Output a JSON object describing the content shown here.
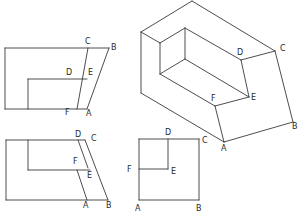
{
  "figure": {
    "type": "orthographic and isometric projections of a stepped block",
    "stroke_color": "#3a3a3a",
    "background": "#ffffff"
  },
  "views": {
    "front_view": {
      "name": "Top-left view",
      "labels": {
        "C": "C",
        "B": "B",
        "D": "D",
        "E": "E",
        "F": "F",
        "A": "A"
      },
      "lines": [
        [
          [
            5,
            48
          ],
          [
            109,
            48
          ]
        ],
        [
          [
            5,
            48
          ],
          [
            5,
            109
          ]
        ],
        [
          [
            5,
            109
          ],
          [
            87,
            109
          ]
        ],
        [
          [
            28,
            79
          ],
          [
            28,
            109
          ]
        ],
        [
          [
            28,
            79
          ],
          [
            87,
            79
          ]
        ],
        [
          [
            88,
            48
          ],
          [
            77,
            109
          ]
        ],
        [
          [
            109,
            48
          ],
          [
            87,
            109
          ]
        ]
      ],
      "label_positions": {
        "C": [
          85,
          44
        ],
        "B": [
          111,
          50
        ],
        "D": [
          66,
          75
        ],
        "E": [
          88,
          75
        ],
        "F": [
          65,
          115
        ],
        "A": [
          86,
          116
        ]
      }
    },
    "top_view": {
      "name": "Bottom-left view",
      "labels": {
        "D": "D",
        "C": "C",
        "F": "F",
        "E": "E",
        "A": "A",
        "B": "B"
      },
      "lines": [
        [
          [
            6,
            140
          ],
          [
            85,
            140
          ]
        ],
        [
          [
            6,
            140
          ],
          [
            6,
            200
          ]
        ],
        [
          [
            6,
            200
          ],
          [
            108,
            200
          ]
        ],
        [
          [
            28,
            140
          ],
          [
            28,
            170
          ]
        ],
        [
          [
            28,
            170
          ],
          [
            90,
            170
          ]
        ],
        [
          [
            78,
            140
          ],
          [
            88,
            168
          ]
        ],
        [
          [
            77,
            170
          ],
          [
            87,
            200
          ]
        ],
        [
          [
            85,
            140
          ],
          [
            108,
            200
          ]
        ]
      ],
      "label_positions": {
        "D": [
          75,
          137
        ],
        "C": [
          91,
          141
        ],
        "F": [
          73,
          164
        ],
        "E": [
          87,
          178
        ],
        "A": [
          83,
          208
        ],
        "B": [
          106,
          208
        ]
      }
    },
    "side_view": {
      "name": "Bottom-middle view",
      "labels": {
        "D": "D",
        "C": "C",
        "F": "F",
        "E": "E",
        "A": "A",
        "B": "B"
      },
      "lines": [
        [
          [
            139,
            139
          ],
          [
            199,
            139
          ]
        ],
        [
          [
            139,
            139
          ],
          [
            139,
            200
          ]
        ],
        [
          [
            139,
            200
          ],
          [
            199,
            200
          ]
        ],
        [
          [
            199,
            139
          ],
          [
            199,
            200
          ]
        ],
        [
          [
            168,
            139
          ],
          [
            168,
            169
          ]
        ],
        [
          [
            139,
            169
          ],
          [
            168,
            169
          ]
        ]
      ],
      "label_positions": {
        "D": [
          165,
          135
        ],
        "C": [
          202,
          143
        ],
        "F": [
          127,
          172
        ],
        "E": [
          171,
          174
        ],
        "A": [
          135,
          211
        ],
        "B": [
          196,
          211
        ]
      }
    },
    "isometric_view": {
      "name": "Right isometric view",
      "labels": {
        "D": "D",
        "C": "C",
        "F": "F",
        "E": "E",
        "A": "A",
        "B": "B"
      },
      "lines": [
        [
          [
            141,
            32
          ],
          [
            192,
            1
          ]
        ],
        [
          [
            192,
            1
          ],
          [
            275,
            51
          ]
        ],
        [
          [
            141,
            32
          ],
          [
            141,
            93
          ]
        ],
        [
          [
            141,
            93
          ],
          [
            224,
            142
          ]
        ],
        [
          [
            224,
            142
          ],
          [
            293,
            122
          ]
        ],
        [
          [
            275,
            51
          ],
          [
            293,
            122
          ]
        ],
        [
          [
            141,
            32
          ],
          [
            160,
            43
          ]
        ],
        [
          [
            160,
            43
          ],
          [
            185,
            28
          ]
        ],
        [
          [
            160,
            43
          ],
          [
            160,
            74
          ]
        ],
        [
          [
            185,
            28
          ],
          [
            185,
            59
          ]
        ],
        [
          [
            185,
            28
          ],
          [
            241,
            60
          ]
        ],
        [
          [
            160,
            74
          ],
          [
            185,
            59
          ]
        ],
        [
          [
            185,
            59
          ],
          [
            249,
            97
          ]
        ],
        [
          [
            160,
            74
          ],
          [
            215,
            106
          ]
        ],
        [
          [
            241,
            60
          ],
          [
            275,
            51
          ]
        ],
        [
          [
            241,
            60
          ],
          [
            249,
            97
          ]
        ],
        [
          [
            215,
            106
          ],
          [
            249,
            97
          ]
        ],
        [
          [
            215,
            106
          ],
          [
            224,
            142
          ]
        ]
      ],
      "label_positions": {
        "D": [
          237,
          55
        ],
        "C": [
          280,
          51
        ],
        "F": [
          211,
          101
        ],
        "E": [
          251,
          100
        ],
        "A": [
          221,
          151
        ],
        "B": [
          292,
          129
        ]
      }
    }
  }
}
